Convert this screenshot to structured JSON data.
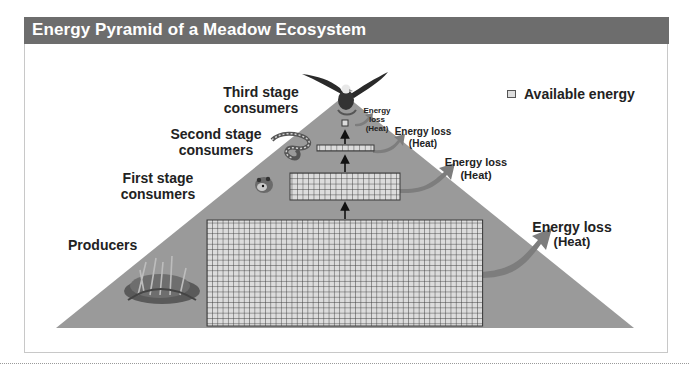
{
  "title": "Energy Pyramid of a Meadow Ecosystem",
  "legend": {
    "label": "Available energy",
    "icon": "grid-cell-icon"
  },
  "levels": [
    {
      "name": "producers",
      "label_line1": "Producers",
      "label_line2": "",
      "organism": "grass-icon",
      "grid_cols": 52,
      "grid_rows": 20
    },
    {
      "name": "first-stage",
      "label_line1": "First stage",
      "label_line2": "consumers",
      "organism": "mouse-icon",
      "grid_cols": 20,
      "grid_rows": 5
    },
    {
      "name": "second-stage",
      "label_line1": "Second stage",
      "label_line2": "consumers",
      "organism": "snake-icon",
      "grid_cols": 10,
      "grid_rows": 1
    },
    {
      "name": "third-stage",
      "label_line1": "Third stage",
      "label_line2": "consumers",
      "organism": "eagle-icon",
      "grid_cols": 1,
      "grid_rows": 1
    }
  ],
  "energy_loss": [
    {
      "line1": "Energy loss",
      "line2": "(Heat)"
    },
    {
      "line1": "Energy loss",
      "line2": "(Heat)"
    },
    {
      "line1": "Energy loss",
      "line2": "(Heat)"
    },
    {
      "line1": "Energy loss",
      "line2": "(Heat)"
    }
  ],
  "colors": {
    "title_bar": "#6d6d6d",
    "pyramid": "#9a9a9a",
    "grid_fill": "#dcdcdc",
    "grid_line": "#3a3a3a",
    "heat_arrow": "#7d7d7d"
  }
}
